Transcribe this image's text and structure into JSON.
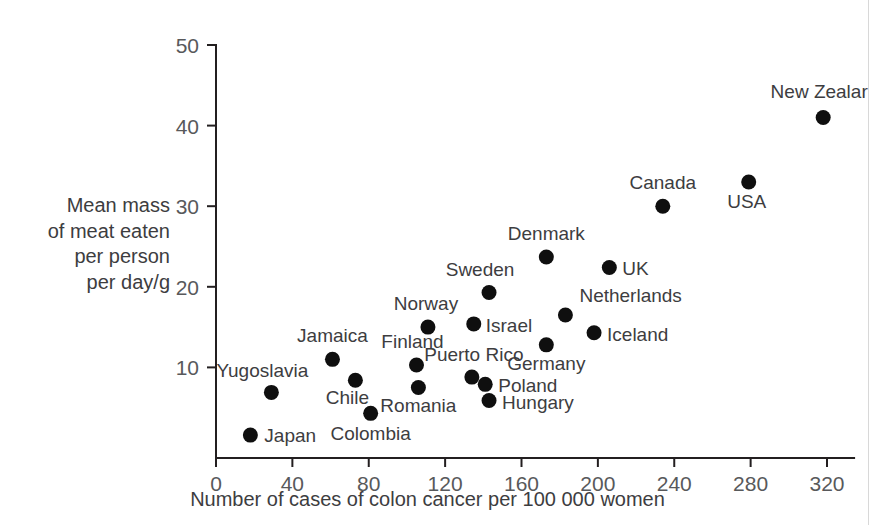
{
  "figure": {
    "background_color": "#ffffff",
    "ink_color": "#231f20",
    "label_color": "#3d3d3f",
    "tick_color": "#58595b",
    "dot_color": "#0f0f0f",
    "page_edge_color": "#d8d8d8"
  },
  "chart_data": {
    "type": "scatter",
    "title": "",
    "xlabel": "Number of cases of colon cancer per 100 000 women",
    "ylabel": "Mean mass of meat eaten per person per day/g",
    "ylabel_lines": [
      "Mean mass",
      "of meat eaten",
      "per person",
      "per day/g"
    ],
    "xlim": [
      0,
      330
    ],
    "ylim": [
      0,
      50
    ],
    "xticks": [
      0,
      40,
      80,
      120,
      160,
      200,
      240,
      280,
      320
    ],
    "yticks": [
      10,
      20,
      30,
      40,
      50
    ],
    "grid": false,
    "legend": "none",
    "points": [
      {
        "name": "Japan",
        "x": 18,
        "y": 1.6,
        "label": "Japan",
        "label_dx": 14,
        "label_dy": 7,
        "anchor": "start"
      },
      {
        "name": "Yugoslavia",
        "x": 29,
        "y": 6.9,
        "label": "Yugoslavia",
        "label_dx": -9,
        "label_dy": -15,
        "anchor": "middle"
      },
      {
        "name": "Jamaica",
        "x": 61,
        "y": 11.0,
        "label": "Jamaica",
        "label_dx": 0,
        "label_dy": -17,
        "anchor": "middle"
      },
      {
        "name": "Chile",
        "x": 73,
        "y": 8.4,
        "label": "Chile",
        "label_dx": -8,
        "label_dy": 24,
        "anchor": "middle"
      },
      {
        "name": "Colombia",
        "x": 81,
        "y": 4.3,
        "label": "Colombia",
        "label_dx": 0,
        "label_dy": 27,
        "anchor": "middle"
      },
      {
        "name": "Finland",
        "x": 105,
        "y": 10.3,
        "label": "Finland",
        "label_dx": -4,
        "label_dy": -17,
        "anchor": "middle"
      },
      {
        "name": "Romania",
        "x": 106,
        "y": 7.5,
        "label": "Romania",
        "label_dx": 0,
        "label_dy": 24,
        "anchor": "middle"
      },
      {
        "name": "Norway",
        "x": 111,
        "y": 15.0,
        "label": "Norway",
        "label_dx": -2,
        "label_dy": -17,
        "anchor": "middle"
      },
      {
        "name": "Puerto Rico",
        "x": 134,
        "y": 8.8,
        "label": "Puerto Rico",
        "label_dx": 2,
        "label_dy": -16,
        "anchor": "middle"
      },
      {
        "name": "Israel",
        "x": 135,
        "y": 15.4,
        "label": "Israel",
        "label_dx": 12,
        "label_dy": 8,
        "anchor": "start"
      },
      {
        "name": "Poland",
        "x": 141,
        "y": 7.9,
        "label": "Poland",
        "label_dx": 13,
        "label_dy": 8,
        "anchor": "start"
      },
      {
        "name": "Sweden",
        "x": 143,
        "y": 19.3,
        "label": "Sweden",
        "label_dx": -9,
        "label_dy": -16,
        "anchor": "middle"
      },
      {
        "name": "Hungary",
        "x": 143,
        "y": 5.9,
        "label": "Hungary",
        "label_dx": 13,
        "label_dy": 9,
        "anchor": "start"
      },
      {
        "name": "Denmark",
        "x": 173,
        "y": 23.7,
        "label": "Denmark",
        "label_dx": 0,
        "label_dy": -17,
        "anchor": "middle"
      },
      {
        "name": "Germany",
        "x": 173,
        "y": 12.8,
        "label": "Germany",
        "label_dx": 0,
        "label_dy": 25,
        "anchor": "middle"
      },
      {
        "name": "Netherlands",
        "x": 183,
        "y": 16.5,
        "label": "Netherlands",
        "label_dx": 14,
        "label_dy": -13,
        "anchor": "start"
      },
      {
        "name": "Iceland",
        "x": 198,
        "y": 14.3,
        "label": "Iceland",
        "label_dx": 13,
        "label_dy": 8,
        "anchor": "start"
      },
      {
        "name": "UK",
        "x": 206,
        "y": 22.4,
        "label": "UK",
        "label_dx": 13,
        "label_dy": 8,
        "anchor": "start"
      },
      {
        "name": "Canada",
        "x": 234,
        "y": 30.0,
        "label": "Canada",
        "label_dx": 0,
        "label_dy": -17,
        "anchor": "middle"
      },
      {
        "name": "USA",
        "x": 279,
        "y": 33.0,
        "label": "USA",
        "label_dx": -2,
        "label_dy": 26,
        "anchor": "middle"
      },
      {
        "name": "New Zealand",
        "x": 318,
        "y": 41.0,
        "label": "New Zealar",
        "label_dx": -4,
        "label_dy": -20,
        "anchor": "middle"
      }
    ]
  }
}
